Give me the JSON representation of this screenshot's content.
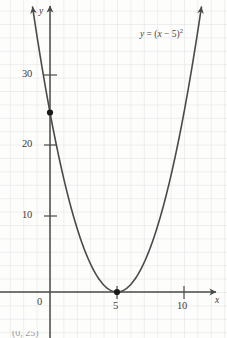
{
  "figure": {
    "background_color": "#fdfdfc",
    "grid_color": "#d9d9de",
    "axis_color": "#4a4a4a",
    "curve_color": "#4a4a4a",
    "point_color": "#1a1a1a",
    "label_color": "#3b3b3b"
  },
  "equation_label": {
    "lhs": "y",
    "equals": " = ",
    "open": "(",
    "var": "x",
    "minus": " − ",
    "root": "5",
    "close": ")",
    "exponent": "2",
    "full_text": "y = (x − 5)²"
  },
  "axes": {
    "x_name": "x",
    "y_name": "y",
    "x_ticks": [
      {
        "label": "0",
        "value": 0
      },
      {
        "label": "5",
        "value": 5
      },
      {
        "label": "10",
        "value": 10
      }
    ],
    "y_ticks": [
      {
        "label": "10",
        "value": 10
      },
      {
        "label": "20",
        "value": 20
      },
      {
        "label": "30",
        "value": 30
      }
    ]
  },
  "caption": {
    "text": "(0, 25)"
  },
  "chart_data": {
    "type": "line",
    "title": "",
    "subtitle": "",
    "xlabel": "x",
    "ylabel": "y",
    "equation": "y = (x - 5)^2",
    "grid": true,
    "legend": null,
    "xlim": [
      -1.5,
      12.5
    ],
    "ylim": [
      -2,
      40.5
    ],
    "xticks": [
      0,
      5,
      10
    ],
    "yticks": [
      10,
      20,
      30
    ],
    "xtick_labels": [
      "0",
      "5",
      "10"
    ],
    "ytick_labels": [
      "10",
      "20",
      "30"
    ],
    "minor_grid_step": 1,
    "series": [
      {
        "name": "y = (x - 5)^2",
        "type": "curve",
        "arrowheads": [
          "start",
          "end"
        ],
        "x": [
          -1.3,
          -1.0,
          -0.5,
          0,
          0.5,
          1,
          1.5,
          2,
          2.5,
          3,
          3.5,
          4,
          4.5,
          5,
          5.5,
          6,
          6.5,
          7,
          7.5,
          8,
          8.5,
          9,
          9.5,
          10,
          10.5,
          11,
          11.3
        ],
        "y": [
          39.69,
          36,
          30.25,
          25,
          20.25,
          16,
          12.25,
          9,
          6.25,
          4,
          2.25,
          1,
          0.25,
          0,
          0.25,
          1,
          2.25,
          4,
          6.25,
          9,
          12.25,
          16,
          20.25,
          25,
          30.25,
          36,
          39.69
        ]
      }
    ],
    "annotations": [
      {
        "type": "point",
        "label": "y-intercept",
        "x": 0,
        "y": 25,
        "marker": "filled-circle"
      },
      {
        "type": "point",
        "label": "vertex",
        "x": 5,
        "y": 0,
        "marker": "filled-circle"
      },
      {
        "type": "text",
        "label": "y = (x − 5)²",
        "x": 8.5,
        "y": 34
      }
    ]
  }
}
